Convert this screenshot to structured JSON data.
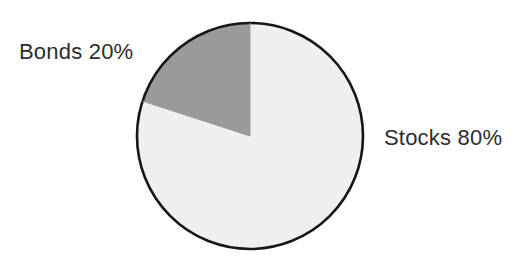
{
  "chart_data": {
    "type": "pie",
    "title": "",
    "subtitle": "",
    "xlabel": "",
    "ylabel": "",
    "grid": false,
    "legend_position": "none",
    "label_style": "outside-direct-label",
    "start_angle_deg": 0,
    "start_angle_description": "12 o'clock",
    "total": 100,
    "units": "%",
    "categories": [
      "Stocks",
      "Bonds"
    ],
    "values": [
      80,
      20
    ],
    "slices": [
      {
        "name": "Stocks",
        "value": 80,
        "percent": "80%",
        "label": "Stocks 80%",
        "color": "#efefef",
        "direction": "clockwise",
        "sweep_deg": 288,
        "label_side": "right"
      },
      {
        "name": "Bonds",
        "value": 20,
        "percent": "20%",
        "label": "Bonds 20%",
        "color": "#9a9a9a",
        "direction": "counter-clockwise",
        "sweep_deg": 72,
        "label_side": "upper-left"
      }
    ],
    "annotations": [
      "Bonds 20%",
      "Stocks 80%"
    ],
    "colors": {
      "background": "#ffffff",
      "outline": "#161616",
      "text": "#2d2d2d",
      "stocks_fill": "#efefef",
      "bonds_fill": "#9a9a9a"
    },
    "geometry": {
      "center_x": 250,
      "center_y": 136,
      "radius": 113,
      "outline_width": 2.6
    }
  },
  "labels": {
    "bonds": "Bonds 20%",
    "stocks": "Stocks 80%"
  }
}
